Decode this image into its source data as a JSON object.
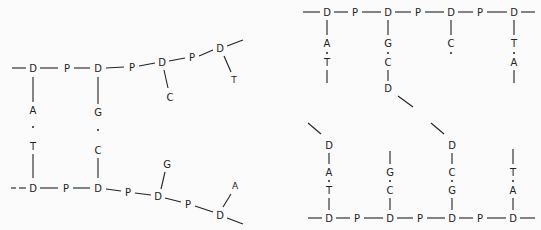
{
  "diagram": {
    "type": "dna-strand-schematic",
    "colors": {
      "background": "#fbfbfb",
      "ink": "#222222"
    },
    "legend": {
      "D": "deoxyribose sugar",
      "P": "phosphate"
    },
    "left_panel": {
      "top_strand": {
        "nodes": [
          {
            "label": "D",
            "x": 33,
            "y": 68
          },
          {
            "label": "P",
            "x": 67,
            "y": 68
          },
          {
            "label": "D",
            "x": 98,
            "y": 68
          },
          {
            "label": "P",
            "x": 132,
            "y": 67
          },
          {
            "label": "D",
            "x": 162,
            "y": 62
          },
          {
            "label": "P",
            "x": 192,
            "y": 57
          },
          {
            "label": "D",
            "x": 220,
            "y": 48
          }
        ],
        "bases": [
          {
            "label": "C",
            "x": 170,
            "y": 97,
            "attached_to": 4
          },
          {
            "label": "T",
            "x": 234,
            "y": 80,
            "attached_to": 6
          }
        ]
      },
      "pairs": [
        {
          "top": "A",
          "bottom": "T",
          "x": 33,
          "top_y": 110,
          "dot_y": 127,
          "bottom_y": 146
        },
        {
          "top": "G",
          "bottom": "C",
          "x": 98,
          "top_y": 112,
          "dot_y": 130,
          "bottom_y": 150
        }
      ],
      "bottom_strand": {
        "nodes": [
          {
            "label": "D",
            "x": 33,
            "y": 188
          },
          {
            "label": "P",
            "x": 66,
            "y": 188
          },
          {
            "label": "D",
            "x": 98,
            "y": 188
          },
          {
            "label": "P",
            "x": 128,
            "y": 192
          },
          {
            "label": "D",
            "x": 158,
            "y": 196
          },
          {
            "label": "P",
            "x": 188,
            "y": 204
          },
          {
            "label": "D",
            "x": 220,
            "y": 215
          }
        ],
        "bases": [
          {
            "label": "G",
            "x": 167,
            "y": 164,
            "attached_to": 4
          },
          {
            "label": "A",
            "x": 235,
            "y": 186,
            "attached_to": 6
          }
        ]
      }
    },
    "right_panel": {
      "top_strand": {
        "nodes": [
          {
            "label": "D",
            "x": 327,
            "y": 12
          },
          {
            "label": "P",
            "x": 355,
            "y": 12
          },
          {
            "label": "D",
            "x": 388,
            "y": 12
          },
          {
            "label": "P",
            "x": 418,
            "y": 12
          },
          {
            "label": "D",
            "x": 451,
            "y": 12
          },
          {
            "label": "P",
            "x": 480,
            "y": 12
          },
          {
            "label": "D",
            "x": 514,
            "y": 12
          }
        ],
        "columns": [
          {
            "x": 327,
            "labels": [
              "A",
              "T"
            ]
          },
          {
            "x": 388,
            "labels": [
              "G",
              "C"
            ],
            "extra_D": {
              "label": "D",
              "y": 88
            }
          },
          {
            "x": 451,
            "labels": [
              "C"
            ]
          },
          {
            "x": 514,
            "labels": [
              "T",
              "A"
            ]
          }
        ]
      },
      "bottom_strand": {
        "nodes": [
          {
            "label": "D",
            "x": 329,
            "y": 218
          },
          {
            "label": "P",
            "x": 357,
            "y": 218
          },
          {
            "label": "D",
            "x": 390,
            "y": 218
          },
          {
            "label": "P",
            "x": 420,
            "y": 218
          },
          {
            "label": "D",
            "x": 452,
            "y": 218
          },
          {
            "label": "P",
            "x": 480,
            "y": 218
          },
          {
            "label": "D",
            "x": 513,
            "y": 218
          }
        ],
        "columns": [
          {
            "x": 329,
            "top_D": {
              "label": "D",
              "y": 145
            },
            "labels": [
              "A",
              "T"
            ]
          },
          {
            "x": 390,
            "labels": [
              "G",
              "C"
            ]
          },
          {
            "x": 452,
            "top_D": {
              "label": "D",
              "y": 145
            },
            "labels": [
              "C",
              "G"
            ]
          },
          {
            "x": 513,
            "labels": [
              "T",
              "A"
            ]
          }
        ]
      }
    },
    "labels": {
      "L_t0": "D",
      "L_t1": "P",
      "L_t2": "D",
      "L_t3": "P",
      "L_t4": "D",
      "L_t5": "P",
      "L_t6": "D",
      "L_tb0": "C",
      "L_tb1": "T",
      "L_p0a": "A",
      "L_p0b": "T",
      "L_p1a": "G",
      "L_p1b": "C",
      "L_b0": "D",
      "L_b1": "P",
      "L_b2": "D",
      "L_b3": "P",
      "L_b4": "D",
      "L_b5": "P",
      "L_b6": "D",
      "L_bb0": "G",
      "L_bb1": "A",
      "R_t0": "D",
      "R_t1": "P",
      "R_t2": "D",
      "R_t3": "P",
      "R_t4": "D",
      "R_t5": "P",
      "R_t6": "D",
      "R_c0a": "A",
      "R_c0b": "T",
      "R_c1a": "G",
      "R_c1b": "C",
      "R_c1d": "D",
      "R_c2a": "C",
      "R_c3a": "T",
      "R_c3b": "A",
      "R_b0": "D",
      "R_b1": "P",
      "R_b2": "D",
      "R_b3": "P",
      "R_b4": "D",
      "R_b5": "P",
      "R_b6": "D",
      "R_u0d": "D",
      "R_u0a": "A",
      "R_u0b": "T",
      "R_u1a": "G",
      "R_u1b": "C",
      "R_u2d": "D",
      "R_u2a": "C",
      "R_u2b": "G",
      "R_u3a": "T",
      "R_u3b": "A"
    }
  }
}
